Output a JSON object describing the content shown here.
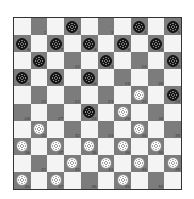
{
  "game": "International draughts (10x10)",
  "board": {
    "size": 10,
    "colors": {
      "light": "#f4f4f4",
      "dark": "#7c7c7c",
      "border": "#333333"
    },
    "squares": [
      {
        "n": 1,
        "piece": null
      },
      {
        "n": 2,
        "piece": "black"
      },
      {
        "n": 3,
        "piece": null
      },
      {
        "n": 4,
        "piece": "black"
      },
      {
        "n": 5,
        "piece": "black"
      },
      {
        "n": 6,
        "piece": "black"
      },
      {
        "n": 7,
        "piece": "black"
      },
      {
        "n": 8,
        "piece": "black"
      },
      {
        "n": 9,
        "piece": "black"
      },
      {
        "n": 10,
        "piece": "black"
      },
      {
        "n": 11,
        "piece": "black"
      },
      {
        "n": 12,
        "piece": null
      },
      {
        "n": 13,
        "piece": "black"
      },
      {
        "n": 14,
        "piece": null
      },
      {
        "n": 15,
        "piece": "black"
      },
      {
        "n": 16,
        "piece": "black"
      },
      {
        "n": 17,
        "piece": "black"
      },
      {
        "n": 18,
        "piece": "black"
      },
      {
        "n": 19,
        "piece": null
      },
      {
        "n": 20,
        "piece": null
      },
      {
        "n": 21,
        "piece": null
      },
      {
        "n": 22,
        "piece": null
      },
      {
        "n": 23,
        "piece": null
      },
      {
        "n": 24,
        "piece": "white"
      },
      {
        "n": 25,
        "piece": "black"
      },
      {
        "n": 26,
        "piece": null
      },
      {
        "n": 27,
        "piece": null
      },
      {
        "n": 28,
        "piece": "black"
      },
      {
        "n": 29,
        "piece": "white"
      },
      {
        "n": 30,
        "piece": null
      },
      {
        "n": 31,
        "piece": "white"
      },
      {
        "n": 32,
        "piece": null
      },
      {
        "n": 33,
        "piece": null
      },
      {
        "n": 34,
        "piece": "white"
      },
      {
        "n": 35,
        "piece": null
      },
      {
        "n": 36,
        "piece": "white"
      },
      {
        "n": 37,
        "piece": "white"
      },
      {
        "n": 38,
        "piece": "white"
      },
      {
        "n": 39,
        "piece": "white"
      },
      {
        "n": 40,
        "piece": "white"
      },
      {
        "n": 41,
        "piece": null
      },
      {
        "n": 42,
        "piece": "white"
      },
      {
        "n": 43,
        "piece": "white"
      },
      {
        "n": 44,
        "piece": "white"
      },
      {
        "n": 45,
        "piece": "white"
      },
      {
        "n": 46,
        "piece": "white"
      },
      {
        "n": 47,
        "piece": "white"
      },
      {
        "n": 48,
        "piece": null
      },
      {
        "n": 49,
        "piece": "white"
      },
      {
        "n": 50,
        "piece": null
      }
    ]
  },
  "piece_counts": {
    "black": 17,
    "white": 18
  }
}
